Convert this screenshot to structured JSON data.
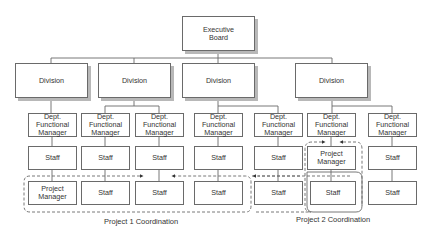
{
  "diagram": {
    "type": "matrix organization chart",
    "executive": {
      "label": "Executive\nBoard"
    },
    "divisions": [
      {
        "label": "Division"
      },
      {
        "label": "Division"
      },
      {
        "label": "Division"
      },
      {
        "label": "Division"
      }
    ],
    "columns": [
      {
        "dept": "Dept.\nFunctional\nManager",
        "row2": "Staff",
        "row3": "Project\nManager"
      },
      {
        "dept": "Dept.\nFunctional\nManager",
        "row2": "Staff",
        "row3": "Staff"
      },
      {
        "dept": "Dept.\nFunctional\nManager",
        "row2": "Staff",
        "row3": "Staff"
      },
      {
        "dept": "Dept.\nFunctional\nManager",
        "row2": "Staff",
        "row3": "Staff"
      },
      {
        "dept": "Dept.\nFunctional\nManager",
        "row2": "Staff",
        "row3": "Staff"
      },
      {
        "dept": "Dept.\nFunctional\nManager",
        "row2": "Project\nManager",
        "row3": "Staff"
      },
      {
        "dept": "Dept.\nFunctional\nManager",
        "row2": "Staff",
        "row3": "Staff"
      }
    ],
    "captions": {
      "project1": "Project 1 Coordination",
      "project2": "Project 2 Coordination"
    },
    "colors": {
      "box_border": "#6a6a6a",
      "shadow": "#b8b8b8",
      "line": "#6a6a6a",
      "dashed": "#6a6a6a"
    }
  }
}
